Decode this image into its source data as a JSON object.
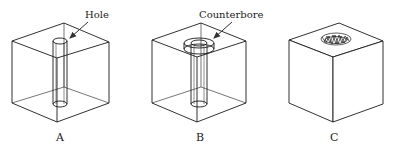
{
  "figures": [
    {
      "id": "A",
      "label": "A",
      "callout": "Hole"
    },
    {
      "id": "B",
      "label": "B",
      "callout": "Counterbore"
    },
    {
      "id": "C",
      "label": "C",
      "callout": ""
    }
  ],
  "colors": {
    "stroke": "#1a1a1a",
    "background": "#ffffff"
  }
}
